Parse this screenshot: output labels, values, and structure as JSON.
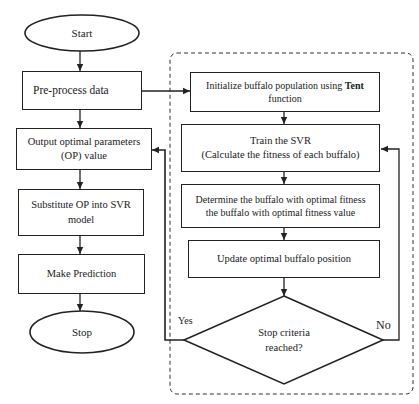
{
  "diagram": {
    "type": "flowchart",
    "main_flow": {
      "start": {
        "label": "Start"
      },
      "preprocess": {
        "label": "Pre-process data"
      },
      "output_op": {
        "label": "Output optimal parameters\n(OP) value"
      },
      "substitute": {
        "label": "Substitute OP into SVR\nmodel"
      },
      "predict": {
        "label": "Make Prediction"
      },
      "stop": {
        "label": "Stop"
      }
    },
    "optimizer_loop": {
      "initialize": {
        "label_prefix": "Initialize buffalo population using ",
        "label_bold": "Tent",
        "label_suffix": "\nfunction"
      },
      "train": {
        "label": "Train the SVR\n(Calculate the fitness of each buffalo)"
      },
      "determine": {
        "label": "Determine the buffalo with optimal fitness\nthe buffalo with optimal fitness value"
      },
      "update": {
        "label": "Update optimal buffalo position"
      },
      "decision": {
        "label": "Stop criteria\nreached?"
      }
    },
    "edge_labels": {
      "yes": "Yes",
      "no": "No"
    },
    "edges": [
      {
        "from": "Start",
        "to": "Pre-process data"
      },
      {
        "from": "Pre-process data",
        "to": "Output optimal parameters (OP) value"
      },
      {
        "from": "Pre-process data",
        "to": "Initialize buffalo population using Tent function"
      },
      {
        "from": "Initialize buffalo population using Tent function",
        "to": "Train the SVR"
      },
      {
        "from": "Train the SVR",
        "to": "Determine the buffalo with optimal fitness"
      },
      {
        "from": "Determine the buffalo with optimal fitness",
        "to": "Update optimal buffalo position"
      },
      {
        "from": "Update optimal buffalo position",
        "to": "Stop criteria reached?"
      },
      {
        "from": "Stop criteria reached?",
        "to": "Output optimal parameters (OP) value",
        "label": "Yes"
      },
      {
        "from": "Stop criteria reached?",
        "to": "Train the SVR",
        "label": "No"
      },
      {
        "from": "Output optimal parameters (OP) value",
        "to": "Substitute OP into SVR model"
      },
      {
        "from": "Substitute OP into SVR model",
        "to": "Make Prediction"
      },
      {
        "from": "Make Prediction",
        "to": "Stop"
      }
    ],
    "colors": {
      "stroke": "#222222",
      "background": "#ffffff"
    }
  }
}
